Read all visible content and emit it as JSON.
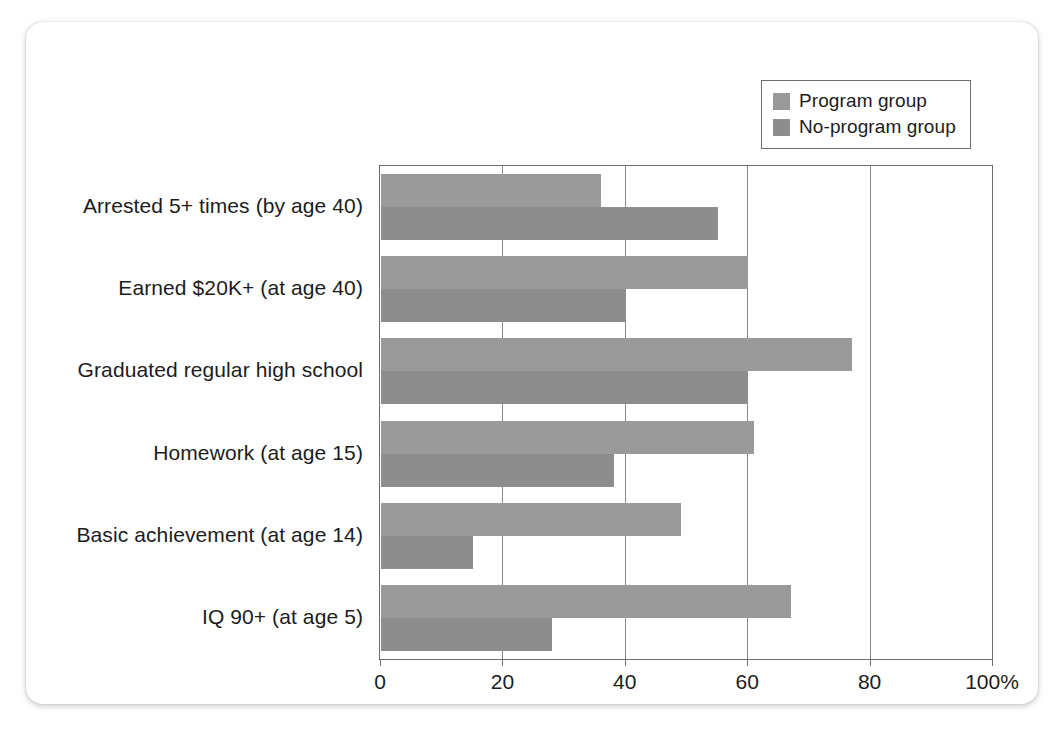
{
  "chart_data": {
    "type": "bar",
    "orientation": "horizontal",
    "title": "",
    "subtitle": "",
    "xlabel": "",
    "ylabel": "",
    "xlim": [
      0,
      100
    ],
    "xticks": [
      0,
      20,
      40,
      60,
      80,
      100
    ],
    "xtick_labels": [
      "0",
      "20",
      "40",
      "60",
      "80",
      "100%"
    ],
    "grid": "vertical",
    "legend_position": "top-right",
    "categories": [
      "Arrested 5+ times (by age 40)",
      "Earned $20K+ (at age 40)",
      "Graduated regular high school",
      "Homework (at age 15)",
      "Basic achievement (at age 14)",
      "IQ 90+ (at age 5)"
    ],
    "series": [
      {
        "name": "Program group",
        "color": "#9a9a9a",
        "values": [
          36,
          60,
          77,
          61,
          49,
          67
        ]
      },
      {
        "name": "No-program group",
        "color": "#8d8d8d",
        "values": [
          55,
          40,
          60,
          38,
          15,
          28
        ]
      }
    ]
  },
  "legend": {
    "items": [
      {
        "label": "Program group",
        "color": "#9a9a9a"
      },
      {
        "label": "No-program group",
        "color": "#8d8d8d"
      }
    ]
  },
  "axis": {
    "tick_labels": [
      "0",
      "20",
      "40",
      "60",
      "80",
      "100%"
    ]
  },
  "colors": {
    "program": "#9a9a9a",
    "noprogram": "#8d8d8d",
    "axis": "#6d6d6d",
    "grid": "#8a8a8a",
    "text": "#1c1c1c",
    "card": "#ffffff"
  }
}
